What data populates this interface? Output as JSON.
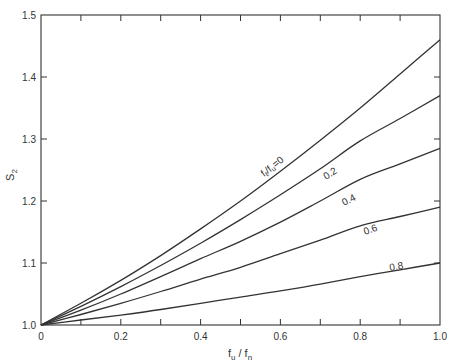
{
  "chart_data": {
    "type": "line",
    "title": "",
    "xlabel": "f_u / f_n",
    "ylabel": "S_2",
    "xlim": [
      0,
      1.0
    ],
    "ylim": [
      1.0,
      1.5
    ],
    "grid": false,
    "legend": "inline curve labels",
    "x_ticks": [
      "0",
      "0.2",
      "0.4",
      "0.6",
      "0.8",
      "1.0"
    ],
    "y_ticks": [
      "1.0",
      "1.1",
      "1.2",
      "1.3",
      "1.4",
      "1.5"
    ],
    "x": [
      0,
      0.1,
      0.2,
      0.3,
      0.4,
      0.5,
      0.6,
      0.7,
      0.8,
      0.9,
      1.0
    ],
    "series": [
      {
        "name": "f_ℓ/f_u = 0",
        "label": "f_ℓ/f_u = 0",
        "values": [
          1.0,
          1.035,
          1.072,
          1.112,
          1.155,
          1.2,
          1.248,
          1.298,
          1.35,
          1.405,
          1.46
        ]
      },
      {
        "name": "0.2",
        "label": "0.2",
        "values": [
          1.0,
          1.03,
          1.062,
          1.096,
          1.132,
          1.17,
          1.21,
          1.252,
          1.297,
          1.333,
          1.37
        ]
      },
      {
        "name": "0.4",
        "label": "0.4",
        "values": [
          1.0,
          1.024,
          1.05,
          1.078,
          1.107,
          1.135,
          1.166,
          1.2,
          1.235,
          1.26,
          1.285
        ]
      },
      {
        "name": "0.6",
        "label": "0.6",
        "values": [
          1.0,
          1.017,
          1.035,
          1.054,
          1.074,
          1.093,
          1.115,
          1.137,
          1.16,
          1.175,
          1.19
        ]
      },
      {
        "name": "0.8",
        "label": "0.8",
        "values": [
          1.0,
          1.008,
          1.016,
          1.025,
          1.035,
          1.045,
          1.055,
          1.066,
          1.078,
          1.089,
          1.1
        ]
      }
    ]
  },
  "labels": {
    "ylabel_main": "S",
    "ylabel_sub": "2",
    "xlabel_num_main": "f",
    "xlabel_num_sub": "u",
    "xlabel_sep": " / ",
    "xlabel_den_main": "f",
    "xlabel_den_sub": "n",
    "curve0_label": "f",
    "curve0_sub1": "ℓ",
    "curve0_mid": "/f",
    "curve0_sub2": "u",
    "curve0_eq": "=0",
    "curve1_label": "0.2",
    "curve2_label": "0.4",
    "curve3_label": "0.6",
    "curve4_label": "0.8"
  },
  "colors": {
    "line": "#333333",
    "background": "#ffffff"
  }
}
